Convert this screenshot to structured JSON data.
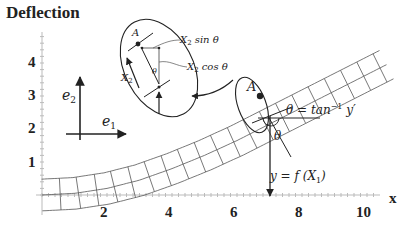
{
  "title": "Deflection",
  "axes": {
    "x_label": "x",
    "x_ticks": [
      "2",
      "4",
      "6",
      "8",
      "10"
    ],
    "y_ticks": [
      "1",
      "2",
      "3",
      "4"
    ]
  },
  "basis": {
    "e1": "e",
    "e1_sub": "1",
    "e2": "e",
    "e2_sub": "2"
  },
  "point_label": "A",
  "inset": {
    "point_label": "A",
    "x2_label": "X",
    "x2_sub": "2",
    "theta": "θ",
    "sin_label_x": "X",
    "sin_label_sub": "2",
    "sin_label_fn": " sin θ",
    "cos_label_x": "X",
    "cos_label_sub": "2",
    "cos_label_fn": " cos θ"
  },
  "annotations": {
    "theta_eq": "θ = tan",
    "theta_eq_sup": "−1",
    "theta_eq_tail": " y′",
    "theta": "θ",
    "curve_eq": "y = f (X",
    "curve_eq_sub": "1",
    "curve_eq_tail": ")"
  },
  "chart_data": {
    "type": "line",
    "title": "Deflection",
    "xlabel": "x",
    "ylabel": "",
    "xlim": [
      0,
      10.5
    ],
    "ylim": [
      0,
      4.5
    ],
    "x_ticks": [
      2,
      4,
      6,
      8,
      10
    ],
    "y_ticks": [
      1,
      2,
      3,
      4
    ],
    "grid": false,
    "series": [
      {
        "name": "beam centerline y = f(X1)",
        "x": [
          0,
          1,
          2,
          3,
          4,
          5,
          6,
          7,
          8,
          9,
          10
        ],
        "y": [
          0.0,
          0.05,
          0.2,
          0.45,
          0.8,
          1.2,
          1.65,
          2.15,
          2.65,
          3.15,
          3.65
        ]
      }
    ],
    "annotations": [
      "A",
      "θ = tan⁻¹ y′",
      "θ",
      "y = f(X₁)",
      "X₂ sin θ",
      "X₂ cos θ",
      "X₂",
      "e₁",
      "e₂"
    ]
  }
}
